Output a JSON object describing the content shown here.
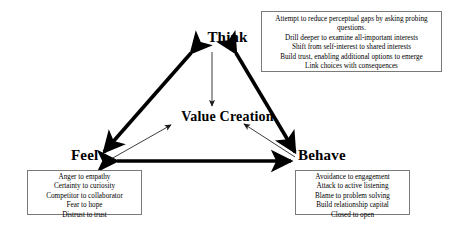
{
  "diagram": {
    "center_label": "Value Creation",
    "nodes": {
      "think": "Think",
      "feel": "Feel",
      "behave": "Behave"
    },
    "colors": {
      "stroke": "#000000",
      "box_border": "#7a7a7a",
      "background": "#ffffff",
      "text": "#000000"
    },
    "connections": [
      {
        "from": "Think",
        "to": "Feel",
        "style": "thick",
        "arrows": "double"
      },
      {
        "from": "Think",
        "to": "Behave",
        "style": "thick",
        "arrows": "double"
      },
      {
        "from": "Feel",
        "to": "Behave",
        "style": "thick",
        "arrows": "double"
      },
      {
        "from": "Think",
        "to": "Value Creation",
        "style": "thin",
        "arrows": "single"
      },
      {
        "from": "Feel",
        "to": "Value Creation",
        "style": "thin",
        "arrows": "single"
      },
      {
        "from": "Behave",
        "to": "Value Creation",
        "style": "thin",
        "arrows": "single"
      }
    ]
  },
  "callouts": {
    "think": [
      "Attempt to reduce perceptual gaps by asking probing questions.",
      "Drill deeper to examine all-important interests",
      "Shift from self-interest to shared interests",
      "Build trust, enabling additional options to emerge",
      "Link choices with consequences"
    ],
    "feel": [
      "Anger to empathy",
      "Certainty to curiosity",
      "Competitor to collaborator",
      "Fear to hope",
      "Distrust to trust"
    ],
    "behave": [
      "Avoidance to engagement",
      "Attack to active listening",
      "Blame to problem solving",
      "Build relationship capital",
      "Closed to open"
    ]
  }
}
